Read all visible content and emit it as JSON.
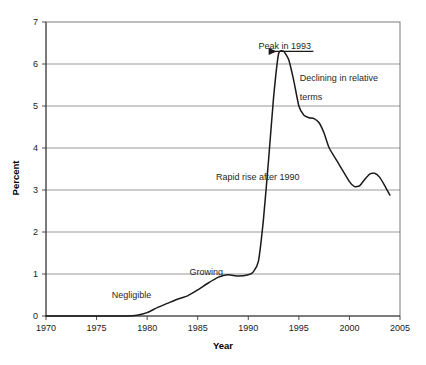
{
  "chart_data": {
    "type": "line",
    "title": "",
    "xlabel": "Year",
    "ylabel": "Percent",
    "xlim": [
      1970,
      2005
    ],
    "ylim": [
      0,
      7
    ],
    "grid": "horizontal",
    "legend": "none",
    "xticks": [
      "1970",
      "1975",
      "1980",
      "1985",
      "1990",
      "1995",
      "2000",
      "2005"
    ],
    "xtick_values": [
      1970,
      1975,
      1980,
      1985,
      1990,
      1995,
      2000,
      2005
    ],
    "yticks": [
      "0",
      "1",
      "2",
      "3",
      "4",
      "5",
      "6",
      "7"
    ],
    "ytick_values": [
      0,
      1,
      2,
      3,
      4,
      5,
      6,
      7
    ],
    "series": [
      {
        "name": "Percent",
        "x": [
          1970,
          1972,
          1974,
          1976,
          1978,
          1979,
          1980,
          1981,
          1982,
          1983,
          1984,
          1985,
          1986,
          1987,
          1988,
          1989,
          1990,
          1990.5,
          1991,
          1991.5,
          1992,
          1992.5,
          1993,
          1993.5,
          1994,
          1994.5,
          1995,
          1995.5,
          1996,
          1996.5,
          1997,
          1997.5,
          1998,
          1999,
          2000,
          2000.5,
          2001,
          2001.5,
          2002,
          2002.5,
          2003,
          2003.5,
          2004
        ],
        "y": [
          0.0,
          0.0,
          0.0,
          0.0,
          0.0,
          0.02,
          0.08,
          0.2,
          0.3,
          0.4,
          0.48,
          0.62,
          0.78,
          0.92,
          0.98,
          0.95,
          0.98,
          1.05,
          1.3,
          2.3,
          3.7,
          5.2,
          6.25,
          6.3,
          6.1,
          5.6,
          5.0,
          4.78,
          4.72,
          4.7,
          4.6,
          4.35,
          4.0,
          3.6,
          3.2,
          3.08,
          3.1,
          3.25,
          3.38,
          3.4,
          3.3,
          3.1,
          2.88
        ]
      }
    ],
    "annotations": [
      {
        "id": "peak-1993",
        "text": "Peak in 1993",
        "x": 1991.0,
        "y": 6.35,
        "arrow": true,
        "arrow_to_x": 1992.9,
        "arrow_to_y": 6.3
      },
      {
        "id": "declining-relative",
        "text": "Declining in relative",
        "x": 1995.1,
        "y": 5.6
      },
      {
        "id": "declining-relative-2",
        "text": "terms",
        "x": 1995.1,
        "y": 5.15
      },
      {
        "id": "rapid-rise",
        "text": "Rapid rise after 1990",
        "x": 1986.8,
        "y": 3.25
      },
      {
        "id": "growing",
        "text": "Growing",
        "x": 1984.2,
        "y": 0.98
      },
      {
        "id": "negligible",
        "text": "Negligible",
        "x": 1976.5,
        "y": 0.42
      }
    ]
  }
}
